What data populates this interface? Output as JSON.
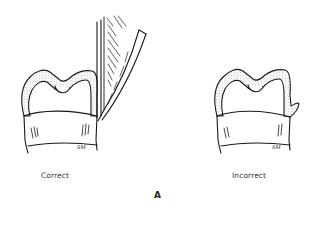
{
  "figure": {
    "panel_label": "A",
    "left": {
      "caption": "Correct",
      "signature": "SM",
      "has_instrument": true
    },
    "right": {
      "caption": "Incorrect",
      "signature": "SM",
      "has_instrument": false
    }
  },
  "colors": {
    "ink": "#1a1a1a",
    "stipple": "#8a8a8a",
    "background": "#ffffff"
  }
}
